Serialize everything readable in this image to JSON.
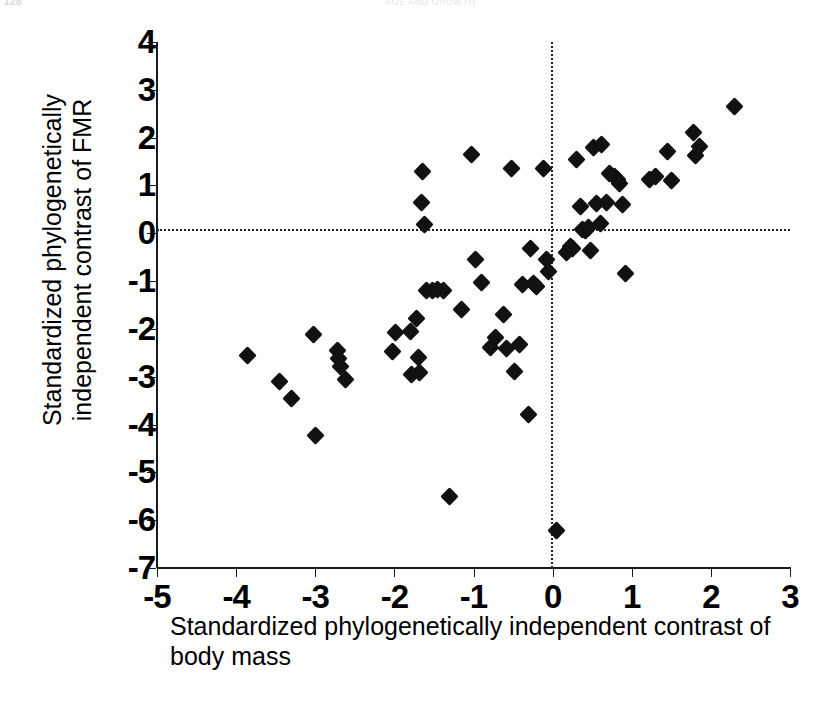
{
  "page": {
    "folio": "128",
    "running_head": "AGE AND GROWTH"
  },
  "chart_data": {
    "type": "scatter",
    "title": "",
    "xlabel": "Standardized phylogenetically independent contrast of body mass",
    "xlabel_line1": "Standardized phylogenetically independent",
    "xlabel_line2": "contrast of body mass",
    "ylabel": "Standardized phylogenetically independent contrast of FMR",
    "ylabel_line1": "Standardized phylogenetically",
    "ylabel_line2": "independent contrast of FMR",
    "xlim": [
      -5,
      3
    ],
    "ylim": [
      -7,
      4
    ],
    "xticks": [
      -5,
      -4,
      -3,
      -2,
      -1,
      0,
      1,
      2,
      3
    ],
    "yticks": [
      4,
      3,
      2,
      1,
      0,
      -1,
      -2,
      -3,
      -4,
      -5,
      -6,
      -7
    ],
    "xtick_labels": [
      "-5",
      "-4",
      "-3",
      "-2",
      "-1",
      "0",
      "1",
      "2",
      "3"
    ],
    "ytick_labels": [
      "4",
      "3",
      "2",
      "1",
      "0",
      "-1",
      "-2",
      "-3",
      "-4",
      "-5",
      "-6",
      "-7"
    ],
    "grid": false,
    "legend": false,
    "reference_lines": [
      {
        "name": "zero-horizontal",
        "orientation": "horizontal",
        "value": 0.08,
        "style": "dotted"
      },
      {
        "name": "zero-vertical",
        "orientation": "vertical",
        "value": -0.02,
        "style": "dotted"
      }
    ],
    "marker": "diamond",
    "marker_color": "#111111",
    "n_points": 72,
    "points": [
      [
        -3.85,
        -2.55
      ],
      [
        -3.45,
        -3.1
      ],
      [
        -3.3,
        -3.45
      ],
      [
        -3.02,
        -2.12
      ],
      [
        -3.0,
        -4.22
      ],
      [
        -2.72,
        -2.45
      ],
      [
        -2.7,
        -2.62
      ],
      [
        -2.68,
        -2.78
      ],
      [
        -2.62,
        -3.05
      ],
      [
        -2.02,
        -2.48
      ],
      [
        -1.98,
        -2.08
      ],
      [
        -1.8,
        -2.05
      ],
      [
        -1.78,
        -2.95
      ],
      [
        -1.72,
        -1.78
      ],
      [
        -1.7,
        -2.6
      ],
      [
        -1.68,
        -2.92
      ],
      [
        -1.66,
        0.65
      ],
      [
        -1.64,
        1.3
      ],
      [
        -1.62,
        0.18
      ],
      [
        -1.6,
        -1.2
      ],
      [
        -1.52,
        -1.2
      ],
      [
        -1.45,
        -1.18
      ],
      [
        -1.38,
        -1.19
      ],
      [
        -1.3,
        -5.5
      ],
      [
        -1.15,
        -1.6
      ],
      [
        -1.02,
        1.65
      ],
      [
        -0.98,
        -0.55
      ],
      [
        -0.9,
        -1.02
      ],
      [
        -0.78,
        -2.38
      ],
      [
        -0.72,
        -2.18
      ],
      [
        -0.62,
        -1.7
      ],
      [
        -0.58,
        -2.42
      ],
      [
        -0.52,
        1.35
      ],
      [
        -0.48,
        -2.9
      ],
      [
        -0.42,
        -2.32
      ],
      [
        -0.38,
        -1.08
      ],
      [
        -0.3,
        -3.78
      ],
      [
        -0.28,
        -0.32
      ],
      [
        -0.24,
        -1.05
      ],
      [
        -0.2,
        -1.12
      ],
      [
        -0.12,
        1.35
      ],
      [
        -0.08,
        -0.55
      ],
      [
        -0.05,
        -0.8
      ],
      [
        0.05,
        -6.22
      ],
      [
        0.18,
        -0.4
      ],
      [
        0.22,
        -0.28
      ],
      [
        0.25,
        -0.32
      ],
      [
        0.3,
        1.55
      ],
      [
        0.35,
        0.55
      ],
      [
        0.38,
        0.08
      ],
      [
        0.42,
        0.05
      ],
      [
        0.45,
        0.12
      ],
      [
        0.48,
        -0.35
      ],
      [
        0.52,
        1.8
      ],
      [
        0.55,
        0.62
      ],
      [
        0.6,
        0.2
      ],
      [
        0.62,
        1.85
      ],
      [
        0.68,
        0.65
      ],
      [
        0.72,
        1.25
      ],
      [
        0.78,
        1.18
      ],
      [
        0.82,
        1.12
      ],
      [
        0.85,
        1.05
      ],
      [
        0.88,
        0.6
      ],
      [
        0.92,
        -0.85
      ],
      [
        1.22,
        1.12
      ],
      [
        1.3,
        1.18
      ],
      [
        1.45,
        1.7
      ],
      [
        1.5,
        1.1
      ],
      [
        1.78,
        2.1
      ],
      [
        1.8,
        1.62
      ],
      [
        1.85,
        1.82
      ],
      [
        2.3,
        2.65
      ]
    ]
  }
}
